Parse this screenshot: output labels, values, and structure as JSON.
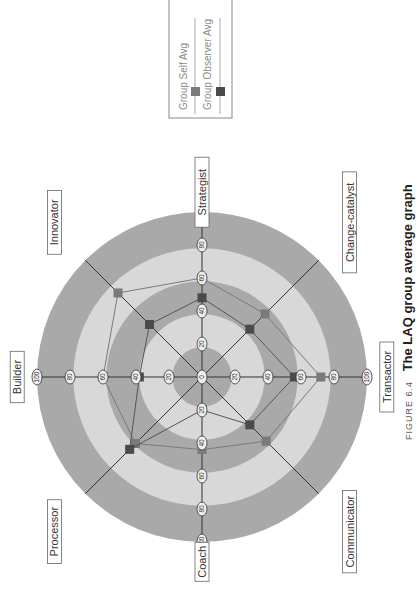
{
  "caption": {
    "prefix": "FIGURE 6.4",
    "title": "The LAQ group average graph"
  },
  "legend": {
    "items": [
      {
        "label": "Group Self Avg",
        "color": "#7a7a7a"
      },
      {
        "label": "Group Observer Avg",
        "color": "#4a4a4a"
      }
    ]
  },
  "colors": {
    "ring_dark": "#a9a9a9",
    "ring_light": "#d8d8d8",
    "axis_line": "#333333",
    "self_line": "#7a7a7a",
    "observer_line": "#555555"
  },
  "chart_data": {
    "type": "radar",
    "title": "The LAQ group average graph",
    "orientation": "page rotated 90° counter-clockwise",
    "axes": [
      "Strategist",
      "Change-catalyst",
      "Transactor",
      "Communicator",
      "Coach",
      "Processor",
      "Builder",
      "Innovator"
    ],
    "ticks": [
      0,
      20,
      40,
      60,
      80,
      100
    ],
    "range": [
      0,
      100
    ],
    "series": [
      {
        "name": "Group Self Avg",
        "values": [
          60,
          54,
          72,
          55,
          44,
          57,
          60,
          72
        ]
      },
      {
        "name": "Group Observer Avg",
        "values": [
          48,
          41,
          56,
          41,
          20,
          62,
          38,
          45
        ]
      }
    ],
    "bands": [
      {
        "from": 0,
        "to": 18,
        "shade": "dark"
      },
      {
        "from": 18,
        "to": 38,
        "shade": "light"
      },
      {
        "from": 38,
        "to": 58,
        "shade": "dark"
      },
      {
        "from": 58,
        "to": 78,
        "shade": "light"
      },
      {
        "from": 78,
        "to": 100,
        "shade": "dark"
      }
    ],
    "legend_position": "top-right"
  }
}
